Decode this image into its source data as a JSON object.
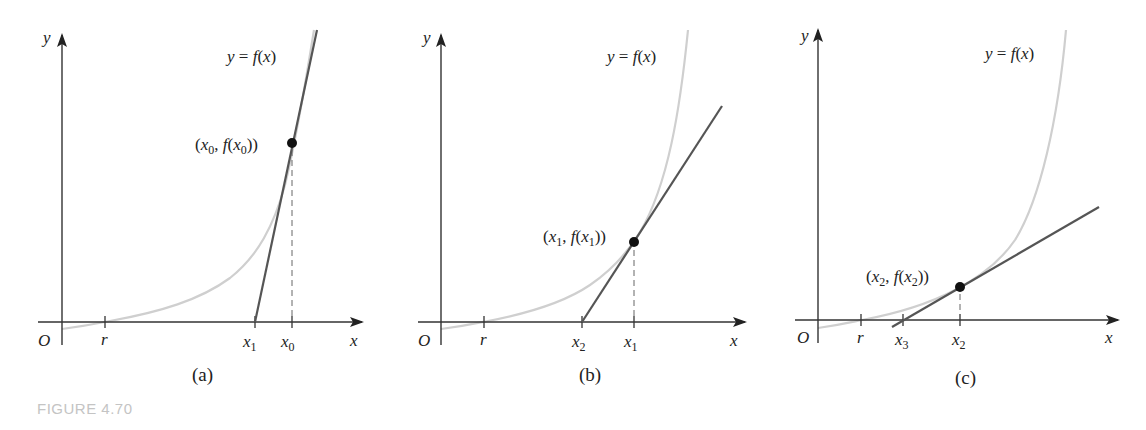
{
  "figure": {
    "caption": "FIGURE 4.70",
    "colors": {
      "axis": "#333333",
      "curve": "#cfcfcf",
      "tangent": "#555555",
      "point": "#111111",
      "caption": "#c4c4c4"
    },
    "panels": [
      {
        "id": "a",
        "label": "(a)",
        "curve_label": "y = f(x)",
        "point_label": "(x0, f(x0))",
        "origin_label": "O",
        "x_axis_label": "x",
        "y_axis_label": "y",
        "ticks": [
          "r",
          "x1",
          "x0"
        ]
      },
      {
        "id": "b",
        "label": "(b)",
        "curve_label": "y = f(x)",
        "point_label": "(x1, f(x1))",
        "origin_label": "O",
        "x_axis_label": "x",
        "y_axis_label": "y",
        "ticks": [
          "r",
          "x2",
          "x1"
        ]
      },
      {
        "id": "c",
        "label": "(c)",
        "curve_label": "y = f(x)",
        "point_label": "(x2, f(x2))",
        "origin_label": "O",
        "x_axis_label": "x",
        "y_axis_label": "y",
        "ticks": [
          "r",
          "x3",
          "x2"
        ]
      }
    ]
  }
}
